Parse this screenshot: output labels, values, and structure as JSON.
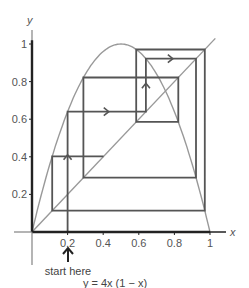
{
  "chart_data": {
    "type": "line",
    "title": "",
    "caption": "y = 4x (1 − x)",
    "xlabel": "x",
    "ylabel": "y",
    "xlim": [
      0,
      1
    ],
    "ylim": [
      0,
      1
    ],
    "grid": false,
    "xticks": [
      0.2,
      0.4,
      0.6,
      0.8,
      1
    ],
    "xtick_labels": [
      "0.2",
      "0.4",
      "0.6",
      "0.8",
      "1"
    ],
    "yticks": [
      0.2,
      0.4,
      0.6,
      0.8,
      1
    ],
    "ytick_labels": [
      "0.2",
      "0.4",
      "0.6",
      "0.8",
      "1"
    ],
    "annotation": "start here",
    "start_x": 0.2,
    "series": [
      {
        "name": "parabola",
        "function": "y = 4x(1 - x)",
        "color": "#999999"
      },
      {
        "name": "diagonal",
        "function": "y = x",
        "color": "#999999"
      },
      {
        "name": "cobweb",
        "color": "#555555",
        "iterates": [
          0.2,
          0.64,
          0.9216,
          0.289,
          0.8219,
          0.5854,
          0.9708,
          0.1133,
          0.4019
        ]
      }
    ],
    "arrows": [
      {
        "at": [
          0.2,
          0.4
        ],
        "direction": "up"
      },
      {
        "at": [
          0.42,
          0.64
        ],
        "direction": "right"
      },
      {
        "at": [
          0.64,
          0.78
        ],
        "direction": "up"
      },
      {
        "at": [
          0.78,
          0.9216
        ],
        "direction": "right"
      }
    ],
    "colors": {
      "axis": "#222222",
      "curve": "#999999",
      "cobweb": "#555555",
      "text": "#555555"
    }
  }
}
